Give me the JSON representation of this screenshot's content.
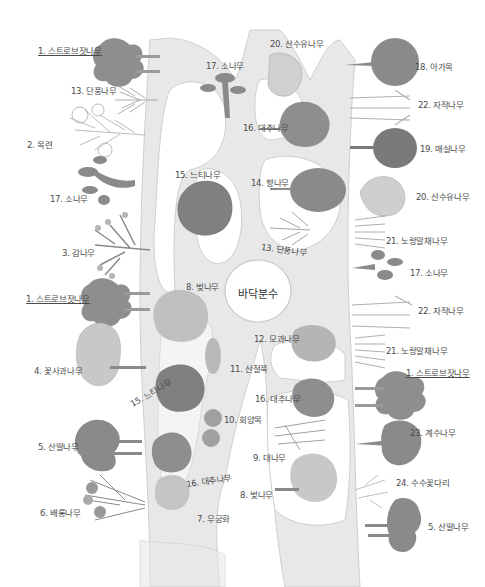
{
  "map": {
    "style": "hand-drawn pencil illustration",
    "colors": {
      "background": "#ffffff",
      "path": "#e6e6e6",
      "path_edge": "#cfcfcf",
      "tree_dark": "#7d7d7d",
      "tree_mid": "#9a9a9a",
      "tree_light": "#c4c4c4",
      "text": "#4a4a4a"
    },
    "landmark": {
      "name": "바닥분수"
    },
    "labels": {
      "l01": "1. 스트로브잣나무",
      "l02": "13. 단풍나무",
      "l03": "2. 목련",
      "l04": "17. 소나무",
      "l05": "3. 감나무",
      "l06": "1. 스트로브잣나무",
      "l07": "4. 꽃사과나무",
      "l08": "5. 산딸나무",
      "l09": "6. 배롱나무",
      "l10": "17. 소나무",
      "l11": "20. 산수유나무",
      "l12": "16. 대추나무",
      "l13": "15. 느티나무",
      "l14": "14. 향나무",
      "l15": "13. 단풍나무",
      "l16": "8. 벚나무",
      "l17": "12. 모과나무",
      "l18": "11. 산철쭉",
      "l19": "15. 느티나무",
      "l20": "16. 대추나무",
      "l21": "10. 회양목",
      "l22": "9. 대나무",
      "l23": "16. 대추나무",
      "l24": "8. 벚나무",
      "l25": "7. 무궁화",
      "l26": "18. 아가목",
      "l27": "22. 자작나무",
      "l28": "19. 매실나무",
      "l29": "20. 산수유나무",
      "l30": "21. 노랑말채나무",
      "l31": "17. 소나무",
      "l32": "22. 자작나무",
      "l33": "21. 노랑말채나무",
      "l34": "1. 스트로브잣나무",
      "l35": "23. 계수나무",
      "l36": "24. 수수꽃다리",
      "l37": "5. 산딸나무"
    }
  }
}
